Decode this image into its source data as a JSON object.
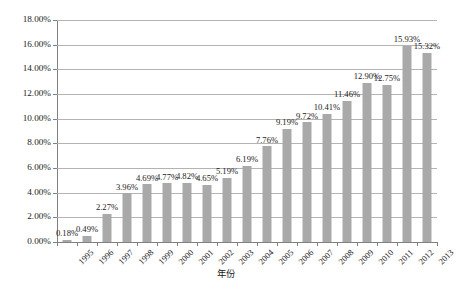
{
  "chart_data": {
    "type": "bar",
    "title": "",
    "subtitle": "",
    "xlabel": "年份",
    "ylabel": "",
    "categories": [
      "1995",
      "1996",
      "1997",
      "1998",
      "1999",
      "2000",
      "2001",
      "2002",
      "2003",
      "2004",
      "2005",
      "2006",
      "2007",
      "2008",
      "2009",
      "2010",
      "2011",
      "2012",
      "2013"
    ],
    "values": [
      0.18,
      0.49,
      2.27,
      3.96,
      4.69,
      4.77,
      4.82,
      4.65,
      5.19,
      6.19,
      7.76,
      9.19,
      9.72,
      10.41,
      11.46,
      12.9,
      12.75,
      15.93,
      15.32
    ],
    "value_labels": [
      "0.18%",
      "0.49%",
      "2.27%",
      "3.96%",
      "4.69%",
      "4.77%",
      "4.82%",
      "4.65%",
      "5.19%",
      "6.19%",
      "7.76%",
      "9.19%",
      "9.72%",
      "10.41%",
      "11.46%",
      "12.90%",
      "12.75%",
      "15.93%",
      "15.32%"
    ],
    "ylim": [
      0,
      18
    ],
    "ytick_values": [
      0,
      2,
      4,
      6,
      8,
      10,
      12,
      14,
      16,
      18
    ],
    "ytick_labels": [
      "0.00%",
      "2.00%",
      "4.00%",
      "6.00%",
      "8.00%",
      "10.00%",
      "12.00%",
      "14.00%",
      "16.00%",
      "18.00%"
    ],
    "grid": true,
    "legend": false,
    "legend_position": "none",
    "series_color": "#a9a9a9",
    "gridline_color": "#b3b3b3",
    "axis_color": "#808080",
    "background_color": "#ffffff",
    "data_labels_shown": true
  }
}
